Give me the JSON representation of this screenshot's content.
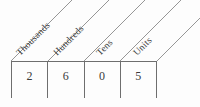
{
  "diagram": {
    "type": "place-value-chart",
    "columns": [
      {
        "label": "Thousands",
        "digit": "2"
      },
      {
        "label": "Hundreds",
        "digit": "6"
      },
      {
        "label": "Tens",
        "digit": "0"
      },
      {
        "label": "Units",
        "digit": "5"
      }
    ],
    "number": "2605",
    "colors": {
      "line": "#6e6e6e",
      "text": "#3a3a3a",
      "background": "#fdfdfd"
    }
  }
}
